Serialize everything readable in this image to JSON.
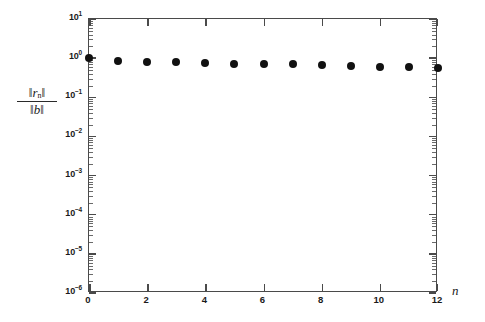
{
  "chart_data": {
    "type": "scatter",
    "title": "",
    "subtitle": "",
    "xlabel": "n",
    "ylabel": "||r_n|| / ||b||",
    "ylabel_numerator": "‖rₖ‖",
    "ylabel_denominator": "‖b‖",
    "xscale": "linear",
    "yscale": "log",
    "xlim": [
      0,
      12
    ],
    "ylim": [
      1e-06,
      10
    ],
    "grid": false,
    "legend": null,
    "marker": "filled-circle",
    "marker_color": "#111111",
    "x": [
      0,
      1,
      2,
      3,
      4,
      5,
      6,
      7,
      8,
      9,
      10,
      11,
      12
    ],
    "values": [
      1.0,
      0.83,
      0.82,
      0.81,
      0.76,
      0.72,
      0.71,
      0.69,
      0.66,
      0.63,
      0.61,
      0.59,
      0.55
    ],
    "xticks": [
      0,
      2,
      4,
      6,
      8,
      10,
      12
    ],
    "xticklabels": [
      "0",
      "2",
      "4",
      "6",
      "8",
      "10",
      "12"
    ],
    "yticks": [
      10,
      1,
      0.1,
      0.01,
      0.001,
      0.0001,
      1e-05,
      1e-06
    ],
    "yticklabels": [
      {
        "mantissa": "10",
        "exponent": "1"
      },
      {
        "mantissa": "10",
        "exponent": "0"
      },
      {
        "mantissa": "10",
        "exponent": "-1"
      },
      {
        "mantissa": "10",
        "exponent": "-2"
      },
      {
        "mantissa": "10",
        "exponent": "-3"
      },
      {
        "mantissa": "10",
        "exponent": "-4"
      },
      {
        "mantissa": "10",
        "exponent": "-5"
      },
      {
        "mantissa": "10",
        "exponent": "-6"
      }
    ],
    "axis_color": "#4a4a4a",
    "background_color": "#ffffff"
  }
}
